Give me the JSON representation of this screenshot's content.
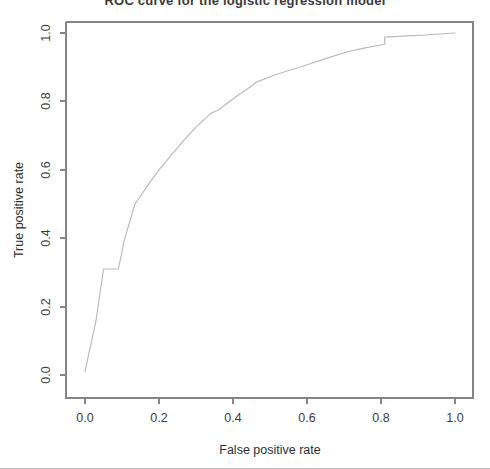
{
  "figure": {
    "background_color": "#ffffff",
    "title_fragment": "ROC curve for the logistic regression model",
    "axis_color": "#848484",
    "line_color": "#b9b9b9",
    "text_color": "#2f2f2f"
  },
  "chart_data": {
    "type": "line",
    "title": "",
    "xlabel": "False positive rate",
    "ylabel": "True positive rate",
    "xlim": [
      0.0,
      1.0
    ],
    "ylim": [
      0.0,
      1.0
    ],
    "grid": false,
    "legend": null,
    "xticks": [
      "0.0",
      "0.2",
      "0.4",
      "0.6",
      "0.8",
      "1.0"
    ],
    "xtick_values": [
      0.0,
      0.2,
      0.4,
      0.6,
      0.8,
      1.0
    ],
    "yticks": [
      "0.0",
      "0.2",
      "0.4",
      "0.6",
      "0.8",
      "1.0"
    ],
    "ytick_values": [
      0.0,
      0.2,
      0.4,
      0.6,
      0.8,
      1.0
    ],
    "series": [
      {
        "name": "ROC curve",
        "color": "#b9b9b9",
        "x": [
          0.0,
          0.01,
          0.03,
          0.05,
          0.09,
          0.1,
          0.105,
          0.135,
          0.17,
          0.2,
          0.235,
          0.27,
          0.3,
          0.34,
          0.36,
          0.41,
          0.45,
          0.46,
          0.52,
          0.58,
          0.65,
          0.71,
          0.75,
          0.8,
          0.81,
          0.81,
          0.86,
          0.92,
          1.0
        ],
        "y": [
          0.01,
          0.06,
          0.16,
          0.31,
          0.31,
          0.36,
          0.39,
          0.5,
          0.555,
          0.6,
          0.645,
          0.69,
          0.725,
          0.765,
          0.775,
          0.815,
          0.845,
          0.855,
          0.88,
          0.9,
          0.925,
          0.945,
          0.955,
          0.965,
          0.967,
          0.988,
          0.991,
          0.994,
          1.0
        ]
      }
    ]
  },
  "axes": {
    "x_axis_label": "False positive rate",
    "y_axis_label": "True positive rate"
  }
}
